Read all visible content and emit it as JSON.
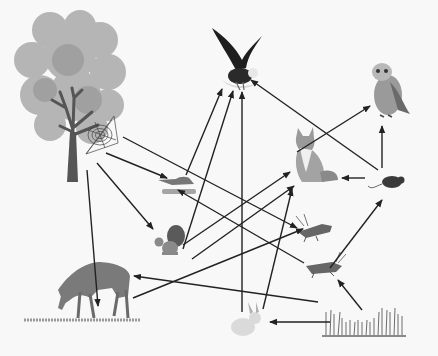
{
  "diagram": {
    "type": "food-web",
    "style": "grayscale illustration",
    "background": "#f8f8f8",
    "arrow_color": "#222222",
    "nodes": [
      {
        "id": "tree",
        "label": "tree",
        "x": 70,
        "y": 95
      },
      {
        "id": "spider",
        "label": "spider web",
        "x": 108,
        "y": 130
      },
      {
        "id": "eagle",
        "label": "eagle",
        "x": 237,
        "y": 60
      },
      {
        "id": "owl",
        "label": "owl",
        "x": 388,
        "y": 92
      },
      {
        "id": "fox",
        "label": "fox",
        "x": 312,
        "y": 158
      },
      {
        "id": "mouse",
        "label": "mouse",
        "x": 390,
        "y": 180
      },
      {
        "id": "bird",
        "label": "small bird",
        "x": 178,
        "y": 185
      },
      {
        "id": "squirrel",
        "label": "squirrel",
        "x": 165,
        "y": 242
      },
      {
        "id": "grasshopper1",
        "label": "grasshopper",
        "x": 312,
        "y": 226
      },
      {
        "id": "grasshopper2",
        "label": "grasshopper",
        "x": 325,
        "y": 267
      },
      {
        "id": "deer",
        "label": "deer",
        "x": 90,
        "y": 290
      },
      {
        "id": "rabbit",
        "label": "rabbit",
        "x": 244,
        "y": 322
      },
      {
        "id": "grass",
        "label": "grass",
        "x": 365,
        "y": 325
      }
    ],
    "edges": [
      {
        "from": "tree",
        "to": "bird",
        "x1": 106,
        "y1": 153,
        "x2": 167,
        "y2": 178
      },
      {
        "from": "tree",
        "to": "squirrel",
        "x1": 97,
        "y1": 163,
        "x2": 153,
        "y2": 229
      },
      {
        "from": "tree",
        "to": "deer",
        "x1": 87,
        "y1": 170,
        "x2": 98,
        "y2": 306
      },
      {
        "from": "tree",
        "to": "grasshopper1",
        "x1": 123,
        "y1": 137,
        "x2": 297,
        "y2": 228
      },
      {
        "from": "bird",
        "to": "eagle",
        "x1": 186,
        "y1": 175,
        "x2": 222,
        "y2": 89
      },
      {
        "from": "squirrel",
        "to": "eagle",
        "x1": 183,
        "y1": 249,
        "x2": 233,
        "y2": 91
      },
      {
        "from": "squirrel",
        "to": "fox",
        "x1": 183,
        "y1": 245,
        "x2": 290,
        "y2": 172
      },
      {
        "from": "squirrel",
        "to": "fox",
        "x1": 192,
        "y1": 259,
        "x2": 294,
        "y2": 186
      },
      {
        "from": "rabbit",
        "to": "eagle",
        "x1": 242,
        "y1": 312,
        "x2": 242,
        "y2": 92
      },
      {
        "from": "rabbit",
        "to": "fox",
        "x1": 263,
        "y1": 309,
        "x2": 292,
        "y2": 189
      },
      {
        "from": "deer",
        "to": "grasshopper1",
        "x1": 133,
        "y1": 298,
        "x2": 303,
        "y2": 229
      },
      {
        "from": "grass",
        "to": "deer",
        "x1": 318,
        "y1": 302,
        "x2": 134,
        "y2": 276
      },
      {
        "from": "grass",
        "to": "rabbit",
        "x1": 330,
        "y1": 322,
        "x2": 270,
        "y2": 322
      },
      {
        "from": "grass",
        "to": "grasshopper2",
        "x1": 362,
        "y1": 310,
        "x2": 338,
        "y2": 280
      },
      {
        "from": "grasshopper2",
        "to": "bird",
        "x1": 304,
        "y1": 263,
        "x2": 178,
        "y2": 190
      },
      {
        "from": "grasshopper2",
        "to": "mouse",
        "x1": 330,
        "y1": 268,
        "x2": 382,
        "y2": 200
      },
      {
        "from": "mouse",
        "to": "fox",
        "x1": 365,
        "y1": 178,
        "x2": 342,
        "y2": 178
      },
      {
        "from": "mouse",
        "to": "owl",
        "x1": 382,
        "y1": 168,
        "x2": 382,
        "y2": 126
      },
      {
        "from": "mouse",
        "to": "eagle",
        "x1": 378,
        "y1": 170,
        "x2": 251,
        "y2": 80
      },
      {
        "from": "fox",
        "to": "owl",
        "x1": 297,
        "y1": 152,
        "x2": 370,
        "y2": 106
      }
    ]
  }
}
